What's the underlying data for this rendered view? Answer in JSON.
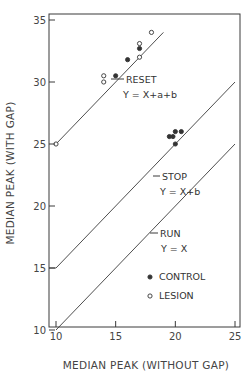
{
  "chart_data": {
    "type": "scatter",
    "title": "",
    "xlabel": "MEDIAN PEAK (WITHOUT GAP)",
    "ylabel": "MEDIAN PEAK (WITH GAP)",
    "xlim": [
      10,
      25
    ],
    "ylim": [
      10,
      35
    ],
    "xticks": [
      10,
      15,
      20,
      25
    ],
    "yticks": [
      10,
      15,
      20,
      25,
      30,
      35
    ],
    "grid": false,
    "legend": {
      "position": "lower right inside",
      "entries": [
        {
          "marker": "filled-circle",
          "label": "CONTROL"
        },
        {
          "marker": "open-circle",
          "label": "LESION"
        }
      ]
    },
    "lines": [
      {
        "name": "RUN",
        "equation": "Y = X",
        "label": "RUN",
        "equation_label": "Y = X",
        "points": [
          [
            10,
            10
          ],
          [
            25,
            25
          ]
        ]
      },
      {
        "name": "STOP",
        "equation": "Y = X+b",
        "label": "STOP",
        "equation_label": "Y = X+b",
        "points": [
          [
            10,
            15
          ],
          [
            25,
            30
          ]
        ]
      },
      {
        "name": "RESET",
        "equation": "Y = X+a+b",
        "label": "RESET",
        "equation_label": "Y = X+a+b",
        "points": [
          [
            10,
            25
          ],
          [
            19,
            34
          ]
        ]
      }
    ],
    "series": [
      {
        "name": "CONTROL",
        "marker": "filled",
        "points": [
          [
            15,
            30.5
          ],
          [
            16,
            31.8
          ],
          [
            17,
            32.7
          ],
          [
            19.5,
            25.6
          ],
          [
            20,
            26
          ],
          [
            20.5,
            26
          ],
          [
            19.8,
            25.6
          ],
          [
            20,
            25
          ]
        ]
      },
      {
        "name": "LESION",
        "marker": "open",
        "points": [
          [
            10,
            25
          ],
          [
            14,
            30
          ],
          [
            14,
            30.5
          ],
          [
            17,
            32
          ],
          [
            17,
            33.1
          ],
          [
            18,
            34
          ]
        ]
      }
    ],
    "annotations": [
      "RESET",
      "Y = X+a+b",
      "STOP",
      "Y = X+b",
      "RUN",
      "Y = X"
    ]
  }
}
